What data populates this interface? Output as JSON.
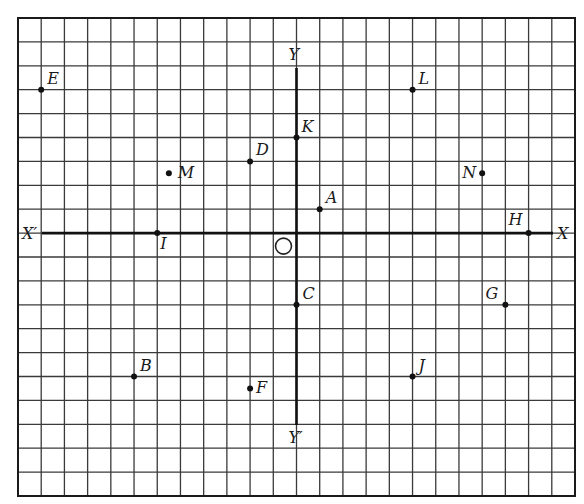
{
  "figure": {
    "colors": {
      "background": "#ffffff",
      "grid": "#3a3a3a",
      "axis": "#1a1a1a",
      "point": "#111111"
    },
    "grid": {
      "columns": 24,
      "rows": 20,
      "left": 18,
      "top": 18,
      "right": 575,
      "bottom": 496
    },
    "origin": {
      "col": 12,
      "row": 9,
      "label": "O"
    },
    "axes": {
      "x_positive_label": "X",
      "x_negative_label": "X′",
      "y_positive_label": "Y",
      "y_negative_label": "Y′",
      "x_extent": [
        -11,
        11
      ],
      "y_extent": [
        -8,
        7
      ]
    },
    "points": [
      {
        "label": "A",
        "x": 1,
        "y": 1,
        "label_dx": 6,
        "label_dy": -6
      },
      {
        "label": "B",
        "x": -7,
        "y": -6,
        "label_dx": 6,
        "label_dy": -6
      },
      {
        "label": "C",
        "x": 0,
        "y": -3,
        "label_dx": 6,
        "label_dy": -6
      },
      {
        "label": "D",
        "x": -2,
        "y": 3,
        "label_dx": 6,
        "label_dy": -6
      },
      {
        "label": "E",
        "x": -11,
        "y": 6,
        "label_dx": 6,
        "label_dy": -6
      },
      {
        "label": "F",
        "x": -2,
        "y": -6.5,
        "label_dx": 6,
        "label_dy": 5
      },
      {
        "label": "G",
        "x": 9,
        "y": -3,
        "label_dx": -20,
        "label_dy": -6
      },
      {
        "label": "H",
        "x": 10,
        "y": 0,
        "label_dx": -20,
        "label_dy": -8
      },
      {
        "label": "I",
        "x": -6,
        "y": 0,
        "label_dx": 3,
        "label_dy": 16
      },
      {
        "label": "J",
        "x": 5,
        "y": -6,
        "label_dx": 6,
        "label_dy": -6
      },
      {
        "label": "K",
        "x": 0,
        "y": 4,
        "label_dx": 5,
        "label_dy": -6
      },
      {
        "label": "L",
        "x": 5,
        "y": 6,
        "label_dx": 6,
        "label_dy": -6
      },
      {
        "label": "M",
        "x": -5.5,
        "y": 2.5,
        "label_dx": 9,
        "label_dy": 5
      },
      {
        "label": "N",
        "x": 8,
        "y": 2.5,
        "label_dx": -20,
        "label_dy": 5
      }
    ]
  }
}
